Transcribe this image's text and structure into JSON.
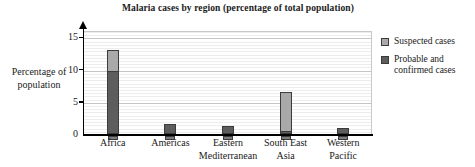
{
  "chart_data": {
    "type": "bar",
    "title": "Malaria cases by region (percentage of total population)",
    "xlabel": "",
    "ylabel": "Percentage of population",
    "categories": [
      "Africa",
      "Americas",
      "Eastern Mediterranean",
      "South East Asia",
      "Western Pacific"
    ],
    "series": [
      {
        "name": "Probable and confirmed cases",
        "color": "#5d5d5d",
        "values": [
          9.8,
          1.5,
          1.2,
          0.5,
          1.0
        ]
      },
      {
        "name": "Suspected cases",
        "color": "#a9a9a9",
        "values": [
          3.2,
          0,
          0,
          6.0,
          0
        ]
      }
    ],
    "stacked": true,
    "totals": [
      13.0,
      1.5,
      1.2,
      6.5,
      1.0
    ],
    "ylim": [
      0,
      16
    ],
    "yticks": [
      0,
      5,
      10,
      15
    ],
    "ytick_labels": [
      "0",
      "5",
      "10",
      "15"
    ],
    "grid": "horizontal",
    "minor_grid_step": 0.5,
    "legend_position": "right"
  },
  "axis": {
    "y_title_line1": "Percentage of",
    "y_title_line2": "population"
  },
  "x_labels": [
    {
      "line1": "Africa",
      "line2": ""
    },
    {
      "line1": "Americas",
      "line2": ""
    },
    {
      "line1": "Eastern",
      "line2": "Mediterranean"
    },
    {
      "line1": "South East",
      "line2": "Asia"
    },
    {
      "line1": "Western",
      "line2": "Pacific"
    }
  ],
  "legend": {
    "items": [
      {
        "label": "Suspected cases",
        "color": "#a9a9a9"
      },
      {
        "label": "Probable and confirmed cases",
        "color": "#5d5d5d"
      }
    ]
  }
}
